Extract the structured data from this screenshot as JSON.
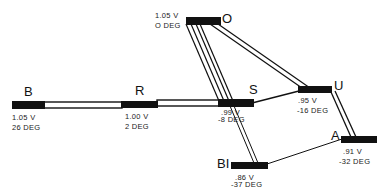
{
  "diagram": {
    "type": "power-system-one-line",
    "colors": {
      "bus": "#111111",
      "line": "#111111",
      "background": "#ffffff"
    },
    "buses": [
      {
        "id": "B",
        "name": "B",
        "voltage": "1.05 V",
        "angle": "26 DEG"
      },
      {
        "id": "R",
        "name": "R",
        "voltage": "1.00 V",
        "angle": "2 DEG"
      },
      {
        "id": "S",
        "name": "S",
        "voltage": ".99 V",
        "angle": "-8 DEG"
      },
      {
        "id": "O",
        "name": "O",
        "voltage": "1.05 V",
        "angle": "O DEG"
      },
      {
        "id": "U",
        "name": "U",
        "voltage": ".95 V",
        "angle": "-16 DEG"
      },
      {
        "id": "A",
        "name": "A",
        "voltage": ".91 V",
        "angle": "-32 DEG"
      },
      {
        "id": "BI",
        "name": "BI",
        "voltage": ".86 V",
        "angle": "-37 DEG"
      }
    ],
    "lines": [
      {
        "from": "B",
        "to": "R",
        "style": "double"
      },
      {
        "from": "R",
        "to": "S",
        "style": "double"
      },
      {
        "from": "O",
        "to": "S",
        "style": "triple"
      },
      {
        "from": "O",
        "to": "U",
        "style": "double"
      },
      {
        "from": "S",
        "to": "U",
        "style": "single"
      },
      {
        "from": "U",
        "to": "A",
        "style": "double"
      },
      {
        "from": "S",
        "to": "BI",
        "style": "double"
      },
      {
        "from": "BI",
        "to": "A",
        "style": "single"
      }
    ]
  }
}
